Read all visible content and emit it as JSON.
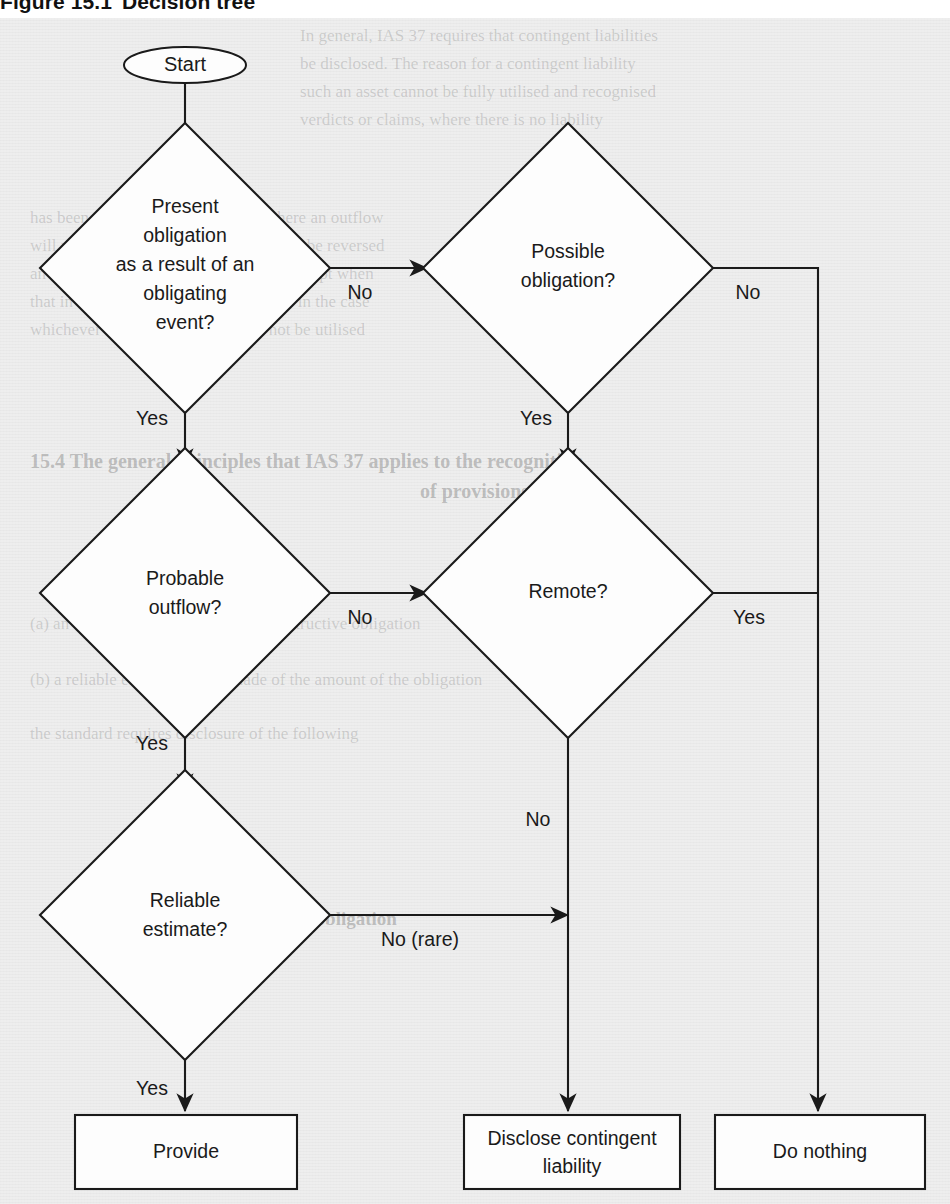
{
  "figure": {
    "caption_number": "Figure 15.1",
    "caption_title": "Decision tree"
  },
  "background": {
    "panel_color": "#e9e9e9",
    "node_fill": "#fdfdfd",
    "line_color": "#1a1a1a"
  },
  "nodes": {
    "start": {
      "label": "Start",
      "shape": "oval"
    },
    "d1": {
      "shape": "diamond",
      "line1": "Present",
      "line2": "obligation",
      "line3": "as a result of an",
      "line4": "obligating",
      "line5": "event?"
    },
    "d2": {
      "shape": "diamond",
      "line1": "Possible",
      "line2": "obligation?"
    },
    "d3": {
      "shape": "diamond",
      "line1": "Probable",
      "line2": "outflow?"
    },
    "d4": {
      "shape": "diamond",
      "line1": "Remote?"
    },
    "d5": {
      "shape": "diamond",
      "line1": "Reliable",
      "line2": "estimate?"
    },
    "t1": {
      "shape": "rect",
      "label": "Provide"
    },
    "t2": {
      "shape": "rect",
      "line1": "Disclose contingent",
      "line2": "liability"
    },
    "t3": {
      "shape": "rect",
      "label": "Do nothing"
    }
  },
  "edge_labels": {
    "d1_no": "No",
    "d1_yes": "Yes",
    "d2_no": "No",
    "d2_yes": "Yes",
    "d3_no": "No",
    "d3_yes": "Yes",
    "d4_no": "No",
    "d4_yes": "Yes",
    "d5_no": "No (rare)",
    "d5_yes": "Yes"
  },
  "ghost_text": {
    "g1": "In general, IAS 37 requires that contingent liabilities",
    "g2": "be disclosed. The reason for a contingent liability",
    "g3": "such an asset cannot be fully utilised and recognised",
    "g4": "verdicts or claims, where there is no liability",
    "g5": "has been a present obligation, and where an outflow",
    "g6": "will not take place, the provision should be reversed",
    "g7": "an interest that the asset of the group, except when",
    "g8": "that in itself, it should only be released in the case",
    "g9": "whichever is greater, where it may not be utilised",
    "g10": "15.4  The general principles that IAS 37 applies to the recognition",
    "g11": "of provisions",
    "g12": "(a)  an entity has a present legal or constructive obligation",
    "g13": "(b)  a reliable estimate can be made of the amount of the obligation",
    "g14": "the standard requires disclosure of the following",
    "g15": "Present obligation"
  }
}
